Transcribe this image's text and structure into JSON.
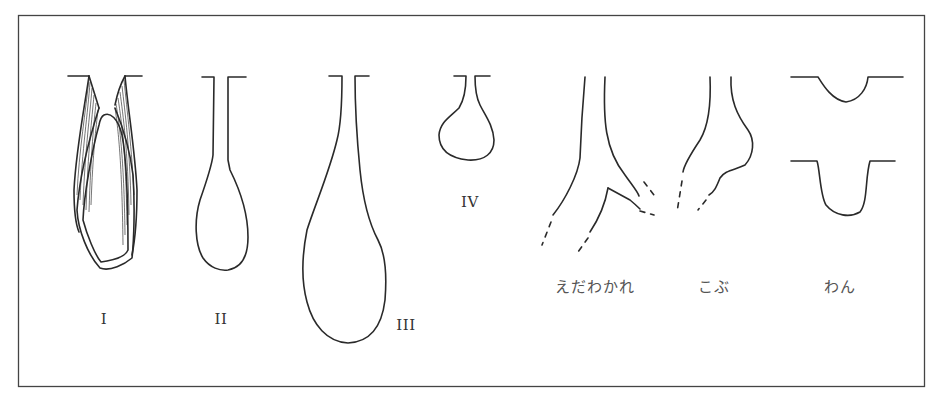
{
  "figure": {
    "type": "line-diagram",
    "colors": {
      "ink": "#2a2a2a",
      "background": "#ffffff",
      "frame": "#444444"
    }
  },
  "labels": {
    "type_1": "I",
    "type_2": "II",
    "type_3": "III",
    "type_4": "IV",
    "branching": "えだわかれ",
    "bump": "こぶ",
    "bowl": "わん"
  }
}
